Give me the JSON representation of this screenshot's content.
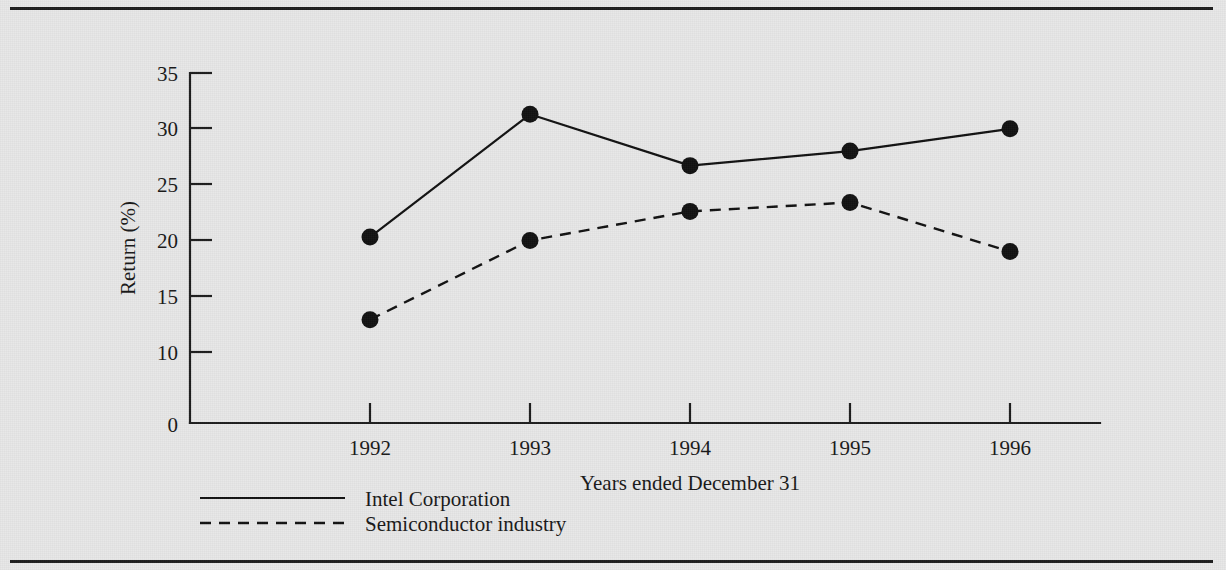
{
  "figure": {
    "background_color": "#e8e8e8",
    "ink_color": "#111111",
    "has_top_rule": true,
    "has_bottom_rule": true
  },
  "chart_data": {
    "type": "line",
    "title": "",
    "xlabel": "Years ended December 31",
    "ylabel": "Return (%)",
    "categories": [
      "1992",
      "1993",
      "1994",
      "1995",
      "1996"
    ],
    "x": [
      1992,
      1993,
      1994,
      1995,
      1996
    ],
    "series": [
      {
        "name": "Intel Corporation",
        "style": "solid",
        "marker": "filled-circle",
        "values": [
          20.3,
          31.3,
          26.7,
          28.0,
          30.0
        ]
      },
      {
        "name": "Semiconductor industry",
        "style": "dashed",
        "marker": "filled-circle",
        "values": [
          12.9,
          20.0,
          22.6,
          23.4,
          19.0
        ]
      }
    ],
    "ytick_labels": [
      "0",
      "10",
      "15",
      "20",
      "25",
      "30",
      "35"
    ],
    "ytick_values": [
      0,
      10,
      15,
      20,
      25,
      30,
      35
    ],
    "ylim": [
      10,
      35
    ],
    "axis_break_below": 10,
    "grid": false,
    "legend_position": "below-axis-left"
  },
  "axes": {
    "y_title": "Return (%)",
    "x_title": "Years ended December 31",
    "origin_label": "0"
  },
  "legend": {
    "entries": [
      {
        "label": "Intel Corporation",
        "style": "solid"
      },
      {
        "label": "Semiconductor industry",
        "style": "dashed"
      }
    ]
  }
}
